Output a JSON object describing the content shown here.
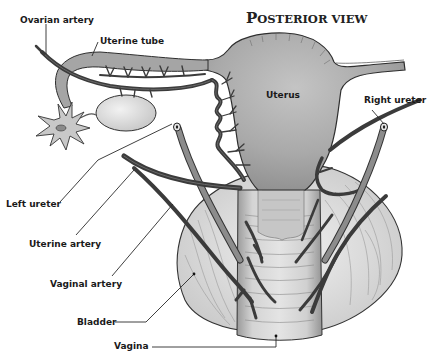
{
  "title": {
    "first_letter": "P",
    "rest": "OSTERIOR VIEW"
  },
  "labels": {
    "ovarian_artery": "Ovarian artery",
    "uterine_tube": "Uterine tube",
    "uterus": "Uterus",
    "right_ureter": "Right ureter",
    "left_ureter": "Left ureter",
    "uterine_artery": "Uterine artery",
    "vaginal_artery": "Vaginal artery",
    "bladder": "Bladder",
    "vagina": "Vagina"
  },
  "colors": {
    "tissue_gray": "#a8a8a8",
    "tissue_light": "#d9d9d9",
    "artery": "#3b3b3b",
    "bladder": "#e6e6e6",
    "vagina": "#cfcfcf"
  }
}
